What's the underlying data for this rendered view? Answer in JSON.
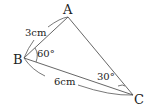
{
  "diagram": {
    "type": "triangle",
    "vertices": {
      "A": {
        "label": "A"
      },
      "B": {
        "label": "B"
      },
      "C": {
        "label": "C"
      }
    },
    "sides": {
      "AB": {
        "label": "3cm"
      },
      "BC": {
        "label": "6cm"
      }
    },
    "angles": {
      "B": {
        "label": "60°"
      },
      "C": {
        "label": "30°"
      }
    },
    "colors": {
      "line": "#555555",
      "text": "#222222"
    }
  }
}
